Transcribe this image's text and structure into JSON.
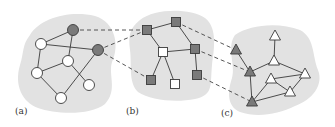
{
  "colors": {
    "background": "#ffffff",
    "blob": "#e2e2e2",
    "node_filled": "#7a7a7a",
    "node_empty": "#ffffff",
    "stroke": "#3a3a3a",
    "dashed": "#444444"
  },
  "panels": [
    {
      "id": "a",
      "label": "(a)",
      "label_pos": [
        15,
        114
      ],
      "shape": "circle",
      "blob_path": "M30,35 C40,18 70,10 95,16 C115,22 120,45 112,62 C108,75 118,90 105,104 C90,116 55,114 38,108 C22,102 14,85 20,65 C24,52 22,45 30,35 Z",
      "nodes": [
        {
          "id": "a1",
          "x": 73,
          "y": 30,
          "filled": true
        },
        {
          "id": "a2",
          "x": 98,
          "y": 50,
          "filled": true
        },
        {
          "id": "a3",
          "x": 41,
          "y": 44,
          "filled": false
        },
        {
          "id": "a4",
          "x": 68,
          "y": 61,
          "filled": false
        },
        {
          "id": "a5",
          "x": 37,
          "y": 73,
          "filled": false
        },
        {
          "id": "a6",
          "x": 89,
          "y": 85,
          "filled": false
        },
        {
          "id": "a7",
          "x": 61,
          "y": 98,
          "filled": false
        }
      ],
      "edges": [
        [
          "a3",
          "a1"
        ],
        [
          "a3",
          "a2"
        ],
        [
          "a1",
          "a4"
        ],
        [
          "a3",
          "a5"
        ],
        [
          "a5",
          "a4"
        ],
        [
          "a5",
          "a7"
        ],
        [
          "a7",
          "a2"
        ],
        [
          "a4",
          "a6"
        ]
      ]
    },
    {
      "id": "b",
      "label": "(b)",
      "label_pos": [
        126,
        114
      ],
      "shape": "square",
      "blob_path": "M140,20 C155,8 190,8 205,18 C218,28 214,50 212,65 C210,85 214,95 195,99 C175,103 150,100 138,92 C128,82 132,65 130,50 C128,35 130,28 140,20 Z",
      "nodes": [
        {
          "id": "b1",
          "x": 147,
          "y": 30,
          "filled": true
        },
        {
          "id": "b2",
          "x": 176,
          "y": 22,
          "filled": true
        },
        {
          "id": "b3",
          "x": 163,
          "y": 52,
          "filled": false
        },
        {
          "id": "b4",
          "x": 195,
          "y": 49,
          "filled": true
        },
        {
          "id": "b5",
          "x": 197,
          "y": 75,
          "filled": true
        },
        {
          "id": "b6",
          "x": 151,
          "y": 80,
          "filled": true
        },
        {
          "id": "b7",
          "x": 175,
          "y": 84,
          "filled": false
        }
      ],
      "edges": [
        [
          "b1",
          "b2"
        ],
        [
          "b1",
          "b3"
        ],
        [
          "b2",
          "b4"
        ],
        [
          "b3",
          "b4"
        ],
        [
          "b3",
          "b6"
        ],
        [
          "b3",
          "b7"
        ],
        [
          "b4",
          "b5"
        ]
      ]
    },
    {
      "id": "c",
      "label": "(c)",
      "label_pos": [
        221,
        116
      ],
      "shape": "triangle",
      "blob_path": "M235,35 C250,24 280,22 300,30 C315,38 312,55 318,70 C324,85 312,100 295,106 C278,114 258,118 240,112 C226,106 228,90 232,78 C236,65 226,48 235,35 Z",
      "nodes": [
        {
          "id": "c1",
          "x": 236,
          "y": 50,
          "filled": true
        },
        {
          "id": "c2",
          "x": 250,
          "y": 72,
          "filled": true
        },
        {
          "id": "c3",
          "x": 252,
          "y": 102,
          "filled": true
        },
        {
          "id": "c4",
          "x": 275,
          "y": 36,
          "filled": false
        },
        {
          "id": "c5",
          "x": 274,
          "y": 61,
          "filled": false
        },
        {
          "id": "c6",
          "x": 271,
          "y": 79,
          "filled": false
        },
        {
          "id": "c7",
          "x": 305,
          "y": 74,
          "filled": false
        },
        {
          "id": "c8",
          "x": 290,
          "y": 92,
          "filled": false
        }
      ],
      "edges": [
        [
          "c1",
          "c2"
        ],
        [
          "c2",
          "c5"
        ],
        [
          "c5",
          "c4"
        ],
        [
          "c2",
          "c3"
        ],
        [
          "c5",
          "c7"
        ],
        [
          "c6",
          "c7"
        ],
        [
          "c6",
          "c8"
        ],
        [
          "c3",
          "c6"
        ],
        [
          "c3",
          "c8"
        ],
        [
          "c8",
          "c7"
        ]
      ]
    }
  ],
  "mappings": [
    [
      "a1",
      "b1"
    ],
    [
      "a2",
      "b1"
    ],
    [
      "a2",
      "b6"
    ],
    [
      "b2",
      "c1"
    ],
    [
      "b4",
      "c2"
    ],
    [
      "b5",
      "c3"
    ]
  ]
}
